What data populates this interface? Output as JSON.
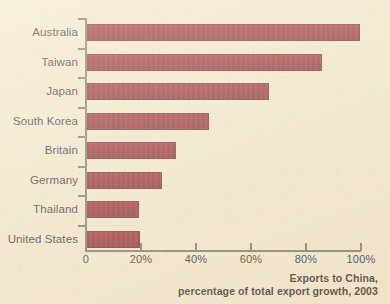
{
  "chart_data": {
    "type": "bar",
    "orientation": "horizontal",
    "title": "",
    "categories": [
      "Australia",
      "Taiwan",
      "Japan",
      "South Korea",
      "Britain",
      "Germany",
      "Thailand",
      "United States"
    ],
    "values": [
      100,
      86,
      67,
      45,
      33,
      28,
      19.5,
      20
    ],
    "xlabel": "",
    "ylabel": "",
    "xlim": [
      0,
      100
    ],
    "xticks": [
      0,
      20,
      40,
      60,
      80,
      100
    ],
    "xtick_labels": [
      "0",
      "20%",
      "40%",
      "60%",
      "80%",
      "100%"
    ],
    "grid": false,
    "legend": false,
    "bar_color": "#8a1622",
    "background_color": "#f1e7cd",
    "axis_color": "#6f6b5e"
  },
  "caption": {
    "line1": "Exports to China,",
    "line2": "percentage of total export growth, 2003"
  }
}
